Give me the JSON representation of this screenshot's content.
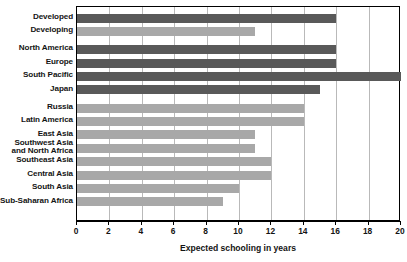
{
  "chart_data": {
    "type": "bar",
    "orientation": "horizontal",
    "title": "",
    "xlabel": "Expected schooling in years",
    "ylabel": "",
    "xlim": [
      0,
      20
    ],
    "xticks": [
      0,
      2,
      4,
      6,
      8,
      10,
      12,
      14,
      16,
      18,
      20
    ],
    "grid": true,
    "legend": "none",
    "categories": [
      "Developed",
      "Developing",
      "North America",
      "Europe",
      "South Pacific",
      "Japan",
      "Russia",
      "Latin America",
      "East Asia",
      "Southwest Asia\nand North Africa",
      "Southeast Asia",
      "Central Asia",
      "South Asia",
      "Sub-Saharan Africa"
    ],
    "values": [
      16,
      11,
      16,
      16,
      20,
      15,
      14,
      14,
      11,
      11,
      12,
      12,
      10,
      9
    ],
    "bar_shades": [
      "dark",
      "light",
      "dark",
      "dark",
      "dark",
      "dark",
      "light",
      "light",
      "light",
      "light",
      "light",
      "light",
      "light",
      "light"
    ],
    "groups": [
      {
        "name": "summary",
        "rows": [
          "Developed",
          "Developing"
        ]
      },
      {
        "name": "high-income-regions",
        "rows": [
          "North America",
          "Europe",
          "South Pacific",
          "Japan"
        ]
      },
      {
        "name": "other-regions",
        "rows": [
          "Russia",
          "Latin America",
          "East Asia",
          "Southwest Asia and North Africa",
          "Southeast Asia",
          "Central Asia",
          "South Asia",
          "Sub-Saharan Africa"
        ]
      }
    ],
    "colors": {
      "bar_dark": "#595959",
      "bar_light": "#a8a8a8",
      "gridline": "#b9b9b9",
      "axis": "#000000",
      "text": "#141414",
      "background": "#ffffff"
    }
  }
}
